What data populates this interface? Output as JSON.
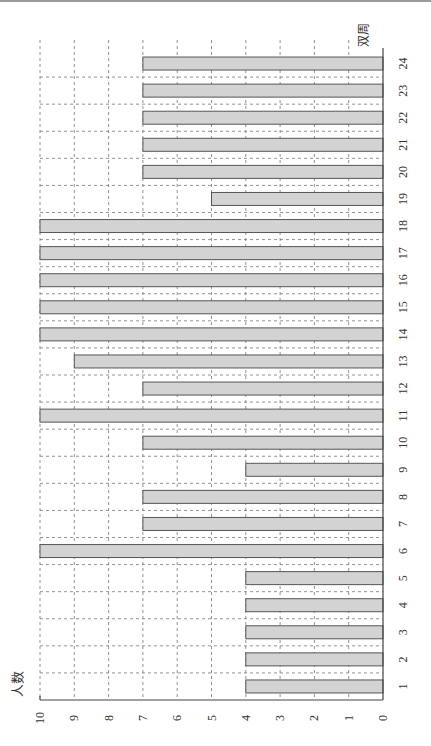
{
  "chart_data": {
    "type": "bar",
    "orientation": "rotated-90-ccw (vertical bar chart printed sideways)",
    "title": "",
    "xlabel": "双周",
    "ylabel": "人数",
    "categories": [
      "1",
      "2",
      "3",
      "4",
      "5",
      "6",
      "7",
      "8",
      "9",
      "10",
      "11",
      "12",
      "13",
      "14",
      "15",
      "16",
      "17",
      "18",
      "19",
      "20",
      "21",
      "22",
      "23",
      "24"
    ],
    "values": [
      4,
      4,
      4,
      4,
      4,
      10,
      7,
      7,
      4,
      7,
      10,
      7,
      9,
      10,
      10,
      10,
      10,
      10,
      5,
      7,
      7,
      7,
      7,
      7
    ],
    "ylim": [
      0,
      10
    ],
    "yticks": [
      "0",
      "1",
      "2",
      "3",
      "4",
      "5",
      "6",
      "7",
      "8",
      "9",
      "10"
    ],
    "grid": true,
    "grid_style": "dashed",
    "bar_color": "#d3d3d3",
    "bar_edge_color": "#555555",
    "legend": null
  },
  "labels": {
    "x_axis": "双周",
    "y_axis": "人数"
  }
}
